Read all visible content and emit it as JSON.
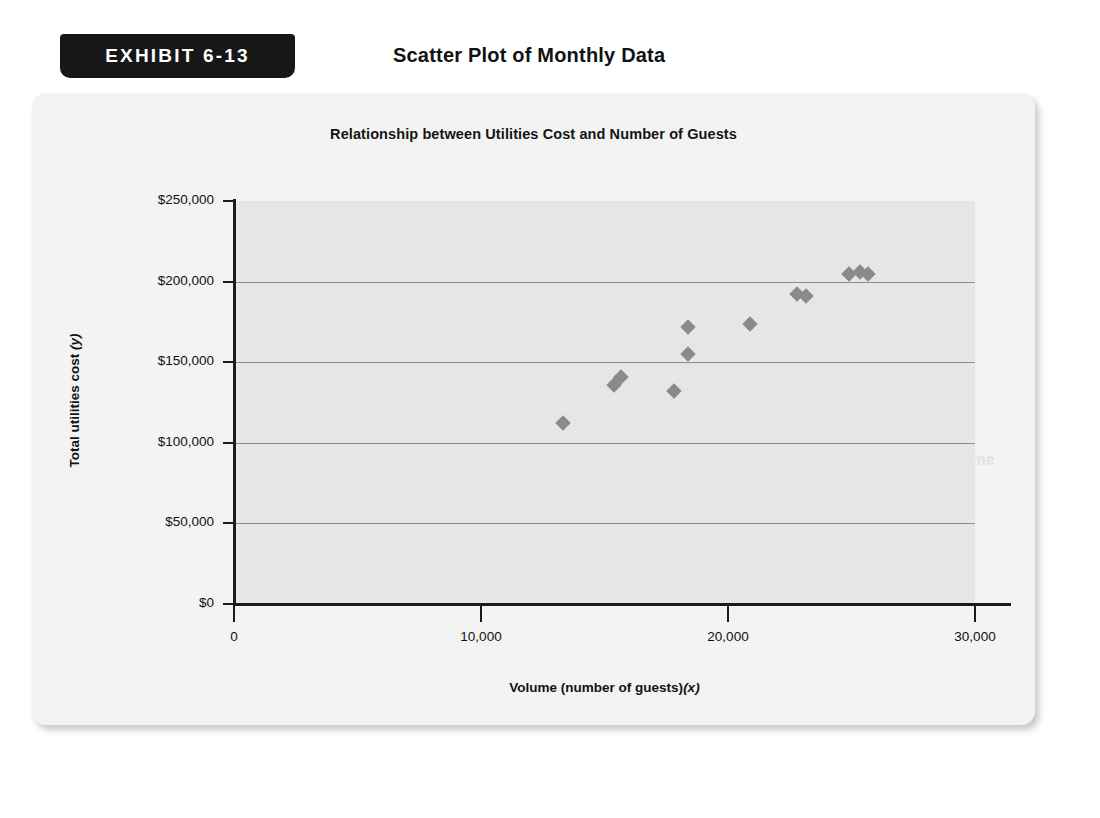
{
  "exhibit": {
    "tag_label": "EXHIBIT 6-13",
    "title": "Scatter Plot of Monthly Data"
  },
  "chart_data": {
    "type": "scatter",
    "title": "Relationship between Utilities Cost and Number of Guests",
    "xlabel": "Volume (number of guests) (x)",
    "ylabel": "Total utilities cost (y)",
    "xlabel_main": "Volume (number of guests)",
    "xlabel_var": "(x)",
    "ylabel_main": "Total utilities cost ",
    "ylabel_var": "(y)",
    "xlim": [
      0,
      30000
    ],
    "ylim": [
      0,
      250000
    ],
    "xticks": [
      0,
      10000,
      20000,
      30000
    ],
    "xticklabels": [
      "0",
      "10,000",
      "20,000",
      "30,000"
    ],
    "yticks": [
      0,
      50000,
      100000,
      150000,
      200000,
      250000
    ],
    "yticklabels": [
      "$0",
      "$50,000",
      "$100,000",
      "$150,000",
      "$200,000",
      "$250,000"
    ],
    "grid": true,
    "grid_axis": "y",
    "legend": false,
    "marker": "diamond",
    "marker_color": "#8a8a8a",
    "plot_bgcolor": "#e6e6e6",
    "points": [
      {
        "x": 13300,
        "y": 112000
      },
      {
        "x": 15400,
        "y": 136000
      },
      {
        "x": 15650,
        "y": 141000
      },
      {
        "x": 17800,
        "y": 132000
      },
      {
        "x": 18400,
        "y": 155000
      },
      {
        "x": 18400,
        "y": 172000
      },
      {
        "x": 20900,
        "y": 174000
      },
      {
        "x": 22800,
        "y": 192000
      },
      {
        "x": 23150,
        "y": 191000
      },
      {
        "x": 24900,
        "y": 205000
      },
      {
        "x": 25350,
        "y": 206000
      },
      {
        "x": 25650,
        "y": 205000
      }
    ]
  },
  "showthrough": {
    "lines": [
      {
        "text": "summarized data",
        "x": 420,
        "y": 218,
        "size": 15
      },
      {
        "text": "to create the scatter plot shown in Exhibit 6-13.",
        "x": 250,
        "y": 244,
        "size": 15
      },
      {
        "text": "EXHIBIT 6-14",
        "x": 500,
        "y": 358,
        "size": 16
      },
      {
        "text": "Estimated Regression on Guest Volume",
        "x": 660,
        "y": 358,
        "size": 16
      },
      {
        "text": "Summary Output",
        "x": 700,
        "y": 386,
        "size": 16
      }
    ]
  }
}
